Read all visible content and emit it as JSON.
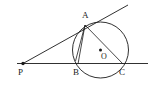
{
  "figure": {
    "width": 153,
    "height": 88,
    "background_color": "#ffffff",
    "stroke_color": "#1a1a1a",
    "labels": {
      "A": "A",
      "B": "B",
      "C": "C",
      "O": "O",
      "P": "P"
    },
    "points": {
      "A": {
        "x": 85,
        "y": 25
      },
      "B": {
        "x": 78,
        "y": 64
      },
      "C": {
        "x": 123,
        "y": 64
      },
      "O": {
        "x": 100.5,
        "y": 50
      },
      "P": {
        "x": 23,
        "y": 63.5
      }
    },
    "circle": {
      "cx": 100.5,
      "cy": 50,
      "r": 28
    },
    "segments": [
      {
        "name": "tangent-line-PA-extended",
        "x1": 23,
        "y1": 63.5,
        "x2": 128,
        "y2": 5
      },
      {
        "name": "secant-line-PBC-extended",
        "x1": 17,
        "y1": 63.5,
        "x2": 148,
        "y2": 63.5
      },
      {
        "name": "chord-AB",
        "x1": 85,
        "y1": 25,
        "x2": 78,
        "y2": 64
      },
      {
        "name": "chord-AC",
        "x1": 85,
        "y1": 25,
        "x2": 123,
        "y2": 64
      },
      {
        "name": "chord-AB-inner",
        "x1": 85,
        "y1": 25,
        "x2": 75.5,
        "y2": 61
      }
    ],
    "dots": [
      {
        "name": "point-marker-P",
        "x": 23,
        "y": 63.5,
        "r": 1.7
      },
      {
        "name": "point-marker-O",
        "x": 100.5,
        "y": 50,
        "r": 1.5
      }
    ]
  }
}
